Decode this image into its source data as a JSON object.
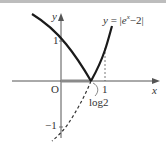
{
  "graph": {
    "equation_label": "y = |e^x − 2|",
    "equation_parts": {
      "lhs": "y",
      "eq": " = |",
      "base": "e",
      "exp": "x",
      "rest": "−2|"
    },
    "x_axis_label": "x",
    "y_axis_label": "y",
    "origin_label": "O",
    "tick_labels": {
      "y_pos_one": "1",
      "y_neg_one": "−1",
      "x_one": "1",
      "log2": "log2"
    },
    "colors": {
      "curve": "#1a1a1a",
      "axis": "#555555",
      "highlight_segment": "#8a8a8a",
      "dashed": "#333333"
    }
  }
}
